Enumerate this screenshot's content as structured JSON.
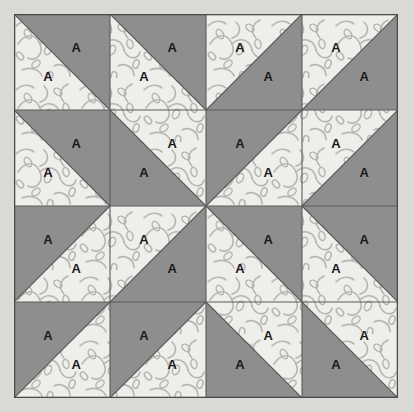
{
  "image": {
    "title": "Half-Square Triangle Quilt Block Diagram",
    "width": 414,
    "height": 412,
    "background_color": "#d9d9d5"
  },
  "block": {
    "name": "quilt-block",
    "rows": 4,
    "columns": 4,
    "cell_size": 96,
    "origin_x": 14,
    "origin_y": 14,
    "width": 384,
    "height": 384,
    "outline_color": "#4a4a4a"
  },
  "fabrics": {
    "solid": {
      "label": "A",
      "color": "#8e8e8e",
      "name": "solid-gray"
    },
    "print": {
      "label": "A",
      "color": "#eeeeea",
      "motif_color": "#b5b5b0",
      "name": "vine-print-light"
    },
    "seam_color": "#555555"
  },
  "patch_label": "A",
  "grid": [
    [
      {
        "cell": "r1c1",
        "diagonal": "backslash",
        "solid_corner": "NE"
      },
      {
        "cell": "r1c2",
        "diagonal": "backslash",
        "solid_corner": "NE"
      },
      {
        "cell": "r1c3",
        "diagonal": "slash",
        "solid_corner": "SE"
      },
      {
        "cell": "r1c4",
        "diagonal": "slash",
        "solid_corner": "SE"
      }
    ],
    [
      {
        "cell": "r2c1",
        "diagonal": "backslash",
        "solid_corner": "NE"
      },
      {
        "cell": "r2c2",
        "diagonal": "backslash",
        "solid_corner": "SW"
      },
      {
        "cell": "r2c3",
        "diagonal": "slash",
        "solid_corner": "NW"
      },
      {
        "cell": "r2c4",
        "diagonal": "slash",
        "solid_corner": "SE"
      }
    ],
    [
      {
        "cell": "r3c1",
        "diagonal": "slash",
        "solid_corner": "NW"
      },
      {
        "cell": "r3c2",
        "diagonal": "slash",
        "solid_corner": "SE"
      },
      {
        "cell": "r3c3",
        "diagonal": "backslash",
        "solid_corner": "NE"
      },
      {
        "cell": "r3c4",
        "diagonal": "backslash",
        "solid_corner": "NE"
      }
    ],
    [
      {
        "cell": "r4c1",
        "diagonal": "slash",
        "solid_corner": "NW"
      },
      {
        "cell": "r4c2",
        "diagonal": "slash",
        "solid_corner": "NW"
      },
      {
        "cell": "r4c3",
        "diagonal": "backslash",
        "solid_corner": "SW"
      },
      {
        "cell": "r4c4",
        "diagonal": "backslash",
        "solid_corner": "SW"
      }
    ]
  ]
}
